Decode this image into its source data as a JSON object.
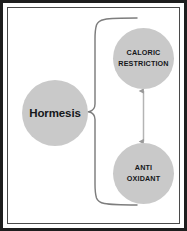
{
  "figure": {
    "background_color": "#ffffff",
    "frame_color": "#1e1e1e",
    "inner_frame_color": "#4a4a4a",
    "node_fill_color": "#c9c9c9",
    "node_text_color": "#15171a",
    "connector_color": "#7d7d7d",
    "watermark_color": "#f3f3f3",
    "watermark_text": ""
  },
  "nodes": {
    "hormesis": {
      "label": "Hormesis",
      "lines": [
        "Hormesis"
      ],
      "shape": "circle",
      "case": "sentence"
    },
    "caloric_restriction": {
      "label": "CALORIC RESTRICTION",
      "lines": [
        "CALORIC",
        "RESTRICTION"
      ],
      "shape": "circle",
      "case": "upper"
    },
    "anti_oxidant": {
      "label": "ANTI OXIDANT",
      "lines": [
        "ANTI",
        "OXIDANT"
      ],
      "shape": "circle",
      "case": "upper"
    }
  },
  "connectors": {
    "brace": {
      "type": "curly-brace",
      "from": "hormesis",
      "to": [
        "caloric_restriction",
        "anti_oxidant"
      ],
      "orientation": "right"
    },
    "vertical_arrow": {
      "type": "double-headed-arrow",
      "from": "anti_oxidant",
      "to": "caloric_restriction",
      "orientation": "vertical"
    }
  }
}
